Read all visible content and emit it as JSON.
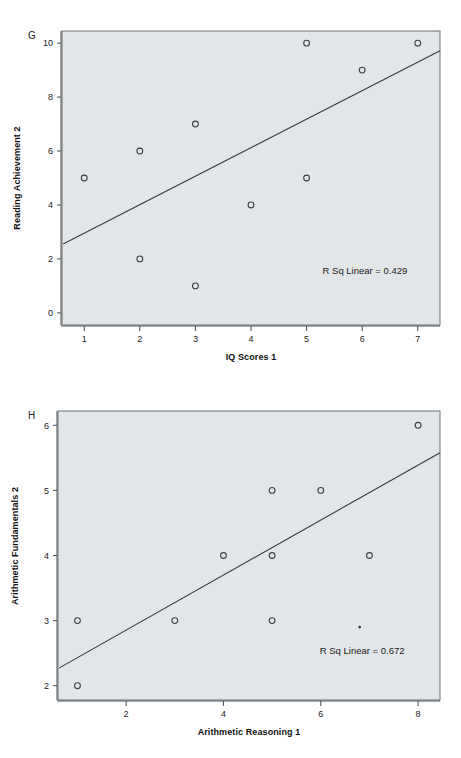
{
  "page": {
    "background": "#ffffff",
    "plot_fill": "#e3e6e8",
    "frame_color": "#6d7276",
    "line_color": "#353a3e",
    "marker_color": "#3c4145"
  },
  "figures": [
    {
      "id": "G",
      "panel_letter": "G",
      "xlabel": "IQ Scores 1",
      "ylabel": "Reading Achievement 2",
      "annotation": "R Sq Linear = 0.429",
      "xticks": [
        "1",
        "2",
        "3",
        "4",
        "5",
        "6",
        "7"
      ],
      "yticks": [
        "0",
        "2",
        "4",
        "6",
        "8",
        "10"
      ]
    },
    {
      "id": "H",
      "panel_letter": "H",
      "xlabel": "Arithmetic Reasoning 1",
      "ylabel": "Arithmetic Fundamentals 2",
      "annotation": "R Sq Linear = 0.672",
      "xticks": [
        "2",
        "4",
        "6",
        "8"
      ],
      "yticks": [
        "2",
        "3",
        "4",
        "5",
        "6"
      ]
    }
  ],
  "chart_data": [
    {
      "type": "scatter",
      "id": "G",
      "title": "G",
      "xlabel": "IQ Scores 1",
      "ylabel": "Reading Achievement 2",
      "xlim": [
        0.6,
        7.4
      ],
      "ylim": [
        -0.45,
        10.45
      ],
      "xticks": [
        1,
        2,
        3,
        4,
        5,
        6,
        7
      ],
      "yticks": [
        0,
        2,
        4,
        6,
        8,
        10
      ],
      "grid": false,
      "legend": "none",
      "annotations": [
        {
          "text": "R Sq Linear = 0.429",
          "x": 6.05,
          "y": 1.45
        }
      ],
      "series": [
        {
          "name": "Reading Achievement 2 vs IQ Scores 1",
          "marker": "open-circle",
          "x": [
            1,
            2,
            2,
            3,
            3,
            4,
            5,
            5,
            6,
            7
          ],
          "y": [
            5,
            6,
            2,
            7,
            1,
            4,
            10,
            5,
            9,
            10
          ]
        }
      ],
      "fit_line": {
        "type": "linear",
        "r_squared": 0.429,
        "label": "R Sq Linear = 0.429",
        "endpoints": {
          "x0": 0.62,
          "y0": 2.55,
          "x1": 7.4,
          "y1": 9.72
        }
      }
    },
    {
      "type": "scatter",
      "id": "H",
      "title": "H",
      "xlabel": "Arithmetic Reasoning 1",
      "ylabel": "Arithmetic Fundamentals 2",
      "xlim": [
        0.6,
        8.45
      ],
      "ylim": [
        1.78,
        6.22
      ],
      "xticks": [
        2,
        4,
        6,
        8
      ],
      "yticks": [
        2,
        3,
        4,
        5,
        6
      ],
      "grid": false,
      "legend": "none",
      "annotations": [
        {
          "text": "R Sq Linear = 0.672",
          "x": 6.85,
          "y": 2.48
        }
      ],
      "series": [
        {
          "name": "Arithmetic Fundamentals 2 vs Arithmetic Reasoning 1",
          "marker": "open-circle",
          "x": [
            1,
            1,
            3,
            4,
            5,
            5,
            5,
            6,
            7,
            8
          ],
          "y": [
            3,
            2,
            3,
            4,
            5,
            4,
            3,
            5,
            4,
            6
          ]
        },
        {
          "name": "small point",
          "marker": "dot",
          "x": [
            6.8
          ],
          "y": [
            2.9
          ]
        }
      ],
      "fit_line": {
        "type": "linear",
        "r_squared": 0.672,
        "label": "R Sq Linear = 0.672",
        "endpoints": {
          "x0": 0.62,
          "y0": 2.27,
          "x1": 8.45,
          "y1": 5.58
        }
      }
    }
  ]
}
